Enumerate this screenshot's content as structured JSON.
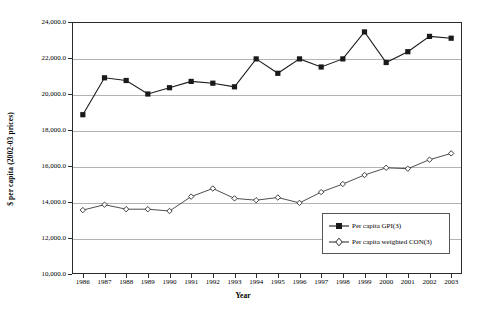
{
  "chart_data": {
    "type": "line",
    "title": "",
    "xlabel": "Year",
    "ylabel": "$ per capita (2002-03 prices)",
    "grid": true,
    "legend_position": "inside-bottom-right",
    "categories": [
      "1986",
      "1987",
      "1988",
      "1989",
      "1990",
      "1991",
      "1992",
      "1993",
      "1994",
      "1995",
      "1996",
      "1997",
      "1998",
      "1999",
      "2000",
      "2001",
      "2002",
      "2003"
    ],
    "x": [
      1986,
      1987,
      1988,
      1989,
      1990,
      1991,
      1992,
      1993,
      1994,
      1995,
      1996,
      1997,
      1998,
      1999,
      2000,
      2001,
      2002,
      2003
    ],
    "ylim": [
      10000,
      24000
    ],
    "ytick_values": [
      10000,
      12000,
      14000,
      16000,
      18000,
      20000,
      22000,
      24000
    ],
    "ytick_labels": [
      "10,000.0",
      "12,000.0",
      "14,000.0",
      "16,000.0",
      "18,000.0",
      "20,000.0",
      "22,000.0",
      "24,000.0"
    ],
    "series": [
      {
        "name": "Per capita GPI(3)",
        "marker": "filled-square",
        "color": "#1a1a1a",
        "values": [
          18850,
          20900,
          20750,
          20000,
          20350,
          20700,
          20600,
          20400,
          21950,
          21150,
          21950,
          21500,
          21950,
          23450,
          21750,
          22350,
          23200,
          23100
        ]
      },
      {
        "name": "Per capita weighted CON(3)",
        "marker": "open-diamond",
        "color": "#3a3a3a",
        "values": [
          13550,
          13850,
          13600,
          13600,
          13500,
          14300,
          14750,
          14200,
          14100,
          14250,
          13950,
          14550,
          15000,
          15500,
          15900,
          15850,
          16350,
          16700
        ]
      }
    ]
  },
  "legend": {
    "items": [
      {
        "label": "Per capita GPI(3)",
        "marker": "filled-square-marker"
      },
      {
        "label": "Per capita weighted CON(3)",
        "marker": "open-diamond-marker"
      }
    ]
  },
  "axes": {
    "x_title": "Year",
    "y_title": "$ per capita (2002-03 prices)"
  }
}
